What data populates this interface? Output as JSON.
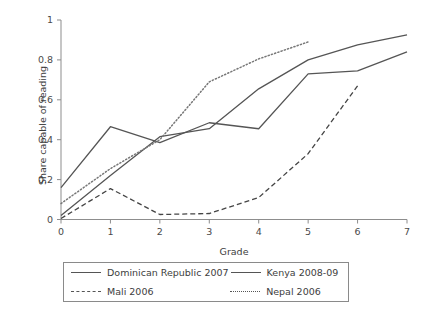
{
  "chart_data": {
    "type": "line",
    "title": "",
    "xlabel": "Grade",
    "ylabel": "Share capable of reading",
    "x": [
      0,
      1,
      2,
      3,
      4,
      5,
      6,
      7
    ],
    "xlim": [
      0,
      7
    ],
    "ylim": [
      0,
      1
    ],
    "xticks": [
      "0",
      "1",
      "2",
      "3",
      "4",
      "5",
      "6",
      "7"
    ],
    "yticks": [
      "0",
      "0.2",
      "0.4",
      "0.6",
      "0.8",
      "1"
    ],
    "grid": false,
    "legend_position": "below-axes",
    "series": [
      {
        "name": "Dominican Republic 2007",
        "style": "solid",
        "color": "#555555",
        "x": [
          0,
          1,
          2,
          3,
          4,
          5,
          6,
          7
        ],
        "values": [
          0.16,
          0.465,
          0.385,
          0.485,
          0.455,
          0.73,
          0.745,
          0.84
        ]
      },
      {
        "name": "Kenya 2008-09",
        "style": "solid",
        "color": "#555555",
        "x": [
          0,
          1,
          2,
          3,
          4,
          5,
          6,
          7
        ],
        "values": [
          0.02,
          0.22,
          0.415,
          0.455,
          0.655,
          0.8,
          0.875,
          0.925
        ]
      },
      {
        "name": "Mali 2006",
        "style": "dashed",
        "color": "#444444",
        "x": [
          0,
          1,
          2,
          3,
          4,
          5,
          6
        ],
        "values": [
          0.005,
          0.155,
          0.025,
          0.03,
          0.11,
          0.33,
          0.67
        ]
      },
      {
        "name": "Nepal 2006",
        "style": "dotted",
        "color": "#777777",
        "x": [
          0,
          1,
          2,
          3,
          4,
          5
        ],
        "values": [
          0.08,
          0.255,
          0.4,
          0.69,
          0.805,
          0.89
        ]
      }
    ]
  },
  "legend": {
    "entries": [
      {
        "label": "Dominican Republic 2007",
        "style": "solid"
      },
      {
        "label": "Kenya 2008-09",
        "style": "solid"
      },
      {
        "label": "Mali 2006",
        "style": "dashed"
      },
      {
        "label": "Nepal 2006",
        "style": "dotted"
      }
    ]
  },
  "axes": {
    "x_label": "Grade",
    "y_label": "Share capable of reading"
  }
}
